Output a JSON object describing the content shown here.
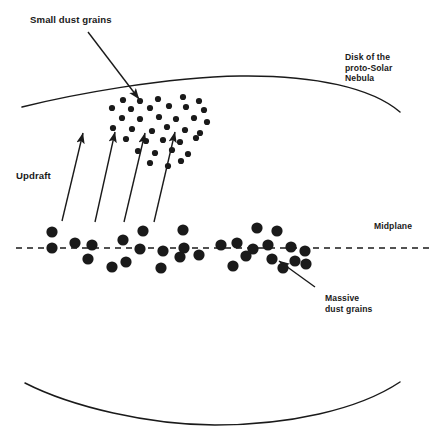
{
  "figure": {
    "width": 445,
    "height": 448,
    "background_color": "#ffffff",
    "ink_color": "#1a1a1a"
  },
  "labels": {
    "small_dust_grains": "Small dust grains",
    "disk_nebula_line1": "Disk of the",
    "disk_nebula_line2": "proto-Solar",
    "disk_nebula_line3": "Nebula",
    "updraft": "Updraft",
    "midplane": "Midplane",
    "massive_grains_line1": "Massive",
    "massive_grains_line2": "dust grains"
  },
  "chart_data": {
    "type": "scatter",
    "xlabel": "",
    "ylabel": "",
    "xlim": [
      0,
      445
    ],
    "ylim": [
      448,
      0
    ],
    "grid": false,
    "legend": "none",
    "annotations": [
      {
        "name": "small-dust-grains",
        "text": "Small dust grains",
        "x": 30,
        "y": 20,
        "arrow_from": [
          88,
          32
        ],
        "arrow_to": [
          141,
          101
        ]
      },
      {
        "name": "disk-of-the-proto-solar-nebula",
        "text": "Disk of the proto-Solar Nebula",
        "x": 345,
        "y": 60
      },
      {
        "name": "updraft",
        "text": "Updraft",
        "x": 16,
        "y": 176
      },
      {
        "name": "midplane",
        "text": "Midplane",
        "x": 374,
        "y": 228
      },
      {
        "name": "massive-dust-grains",
        "text": "Massive dust grains",
        "x": 325,
        "y": 300,
        "arrow_from": [
          315,
          287
        ],
        "arrow_to": [
          277,
          259
        ]
      }
    ],
    "series": [
      {
        "name": "small-dust-grains",
        "marker": "dot",
        "marker_size": 3.1,
        "color": "#1a1a1a",
        "points": [
          [
            123,
            100
          ],
          [
            140,
            101
          ],
          [
            158,
            99
          ],
          [
            183,
            97
          ],
          [
            199,
            101
          ],
          [
            112,
            108
          ],
          [
            131,
            109
          ],
          [
            150,
            108
          ],
          [
            169,
            106
          ],
          [
            186,
            107
          ],
          [
            204,
            110
          ],
          [
            122,
            118
          ],
          [
            140,
            119
          ],
          [
            159,
            117
          ],
          [
            176,
            119
          ],
          [
            194,
            118
          ],
          [
            207,
            122
          ],
          [
            113,
            128
          ],
          [
            132,
            129
          ],
          [
            152,
            131
          ],
          [
            167,
            127
          ],
          [
            185,
            130
          ],
          [
            200,
            133
          ],
          [
            126,
            139
          ],
          [
            146,
            141
          ],
          [
            163,
            140
          ],
          [
            180,
            142
          ],
          [
            196,
            138
          ],
          [
            138,
            151
          ],
          [
            155,
            153
          ],
          [
            172,
            150
          ],
          [
            188,
            154
          ],
          [
            150,
            163
          ],
          [
            168,
            166
          ],
          [
            181,
            161
          ]
        ]
      },
      {
        "name": "massive-dust-grains",
        "marker": "dot",
        "marker_size": 5.6,
        "color": "#1a1a1a",
        "points": [
          [
            52,
            232
          ],
          [
            143,
            231
          ],
          [
            183,
            230
          ],
          [
            257,
            228
          ],
          [
            277,
            231
          ],
          [
            52,
            248
          ],
          [
            75,
            243
          ],
          [
            92,
            245
          ],
          [
            123,
            240
          ],
          [
            140,
            249
          ],
          [
            163,
            251
          ],
          [
            184,
            248
          ],
          [
            221,
            245
          ],
          [
            237,
            243
          ],
          [
            253,
            249
          ],
          [
            268,
            245
          ],
          [
            291,
            247
          ],
          [
            305,
            251
          ],
          [
            88,
            259
          ],
          [
            126,
            262
          ],
          [
            180,
            257
          ],
          [
            199,
            255
          ],
          [
            246,
            256
          ],
          [
            272,
            259
          ],
          [
            295,
            261
          ],
          [
            112,
            267
          ],
          [
            161,
            268
          ],
          [
            233,
            266
          ],
          [
            283,
            268
          ],
          [
            306,
            264
          ]
        ]
      }
    ],
    "curves": [
      {
        "name": "disk-upper-surface",
        "path": [
          [
            22,
            107
          ],
          [
            120,
            86
          ],
          [
            240,
            76
          ],
          [
            330,
            85
          ],
          [
            400,
            112
          ]
        ]
      },
      {
        "name": "disk-lower-surface",
        "path": [
          [
            25,
            383
          ],
          [
            120,
            411
          ],
          [
            215,
            425
          ],
          [
            320,
            410
          ],
          [
            400,
            382
          ]
        ]
      },
      {
        "name": "midplane-axis",
        "path": [
          [
            16,
            248
          ],
          [
            430,
            248
          ]
        ],
        "style": "dashed"
      }
    ],
    "arrows": [
      {
        "name": "updraft-arrow-1",
        "from": [
          62,
          221
        ],
        "to": [
          83,
          131
        ]
      },
      {
        "name": "updraft-arrow-2",
        "from": [
          95,
          222
        ],
        "to": [
          115,
          130
        ]
      },
      {
        "name": "updraft-arrow-3",
        "from": [
          124,
          222
        ],
        "to": [
          145,
          131
        ]
      },
      {
        "name": "updraft-arrow-4",
        "from": [
          154,
          222
        ],
        "to": [
          175,
          130
        ]
      },
      {
        "name": "small-dust-grains-pointer",
        "from": [
          88,
          32
        ],
        "to": [
          141,
          101
        ]
      },
      {
        "name": "massive-dust-grains-pointer",
        "from": [
          315,
          287
        ],
        "to": [
          277,
          259
        ]
      }
    ]
  }
}
